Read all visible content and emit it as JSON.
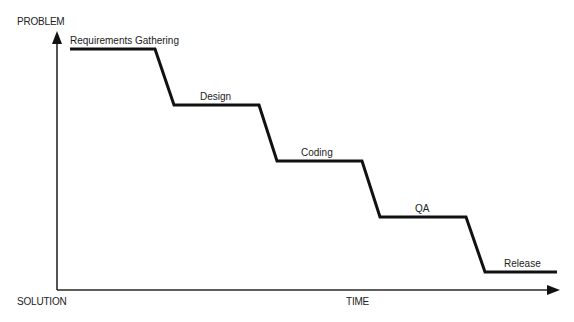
{
  "diagram": {
    "type": "step-down process diagram",
    "axes": {
      "y_top_label": "PROBLEM",
      "y_bottom_label": "SOLUTION",
      "x_label": "TIME"
    },
    "stages": [
      {
        "label": "Requirements Gathering",
        "order": 1
      },
      {
        "label": "Design",
        "order": 2
      },
      {
        "label": "Coding",
        "order": 3
      },
      {
        "label": "QA",
        "order": 4
      },
      {
        "label": "Release",
        "order": 5
      }
    ],
    "colors": {
      "line": "#111111",
      "axis": "#2a2a2a",
      "text": "#222222",
      "background": "#ffffff"
    }
  }
}
